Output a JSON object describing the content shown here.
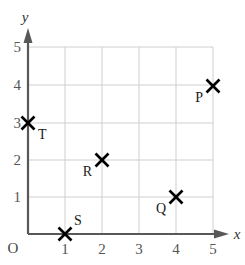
{
  "chart_data": {
    "type": "scatter",
    "title": "",
    "xlabel": "x",
    "ylabel": "y",
    "origin_label": "O",
    "xlim": [
      0,
      5
    ],
    "ylim": [
      0,
      5
    ],
    "xticks": [
      "1",
      "2",
      "3",
      "4",
      "5"
    ],
    "yticks": [
      "1",
      "2",
      "3",
      "4",
      "5"
    ],
    "grid": true,
    "legend": "none",
    "marker": "x-cross",
    "points": [
      {
        "label": "P",
        "x": 5,
        "y": 4,
        "label_pos": "lower-left"
      },
      {
        "label": "Q",
        "x": 4,
        "y": 1,
        "label_pos": "lower-left"
      },
      {
        "label": "R",
        "x": 2,
        "y": 2,
        "label_pos": "lower-left"
      },
      {
        "label": "S",
        "x": 1,
        "y": 0,
        "label_pos": "upper-right"
      },
      {
        "label": "T",
        "x": 0,
        "y": 3,
        "label_pos": "lower-right"
      }
    ],
    "colors": {
      "grid": "#cfcfcf",
      "axis": "#585858",
      "marker": "#000000",
      "tick_text": "#555555",
      "background": "#ffffff"
    }
  }
}
